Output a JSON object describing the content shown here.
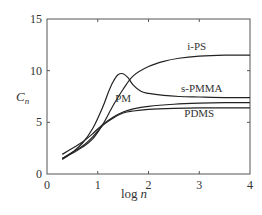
{
  "chart_data": {
    "type": "line",
    "title": "",
    "xlabel": "log n",
    "ylabel": "C_n",
    "xlim": [
      0,
      4
    ],
    "ylim": [
      0,
      15
    ],
    "xticks": [
      0,
      1,
      2,
      3,
      4
    ],
    "yticks": [
      0,
      5,
      10,
      15
    ],
    "grid": false,
    "legend": "inline labels",
    "series": [
      {
        "name": "i-PS",
        "x": [
          0.3,
          0.5,
          0.7,
          0.9,
          1.1,
          1.3,
          1.5,
          1.7,
          2.0,
          2.3,
          2.6,
          3.0,
          3.5,
          4.0
        ],
        "y": [
          1.5,
          2.0,
          2.6,
          3.4,
          4.8,
          6.6,
          8.2,
          9.5,
          10.4,
          10.9,
          11.2,
          11.4,
          11.5,
          11.5
        ]
      },
      {
        "name": "s-PMMA",
        "x": [
          0.3,
          0.5,
          0.7,
          0.9,
          1.1,
          1.2,
          1.3,
          1.4,
          1.5,
          1.6,
          1.7,
          1.85,
          2.0,
          2.3,
          2.6,
          3.0,
          3.5,
          4.0
        ],
        "y": [
          1.4,
          2.1,
          3.0,
          4.4,
          6.5,
          7.8,
          8.9,
          9.6,
          9.7,
          9.3,
          8.6,
          8.0,
          7.8,
          7.6,
          7.5,
          7.45,
          7.4,
          7.4
        ]
      },
      {
        "name": "PM",
        "x": [
          0.3,
          0.5,
          0.7,
          0.9,
          1.1,
          1.3,
          1.5,
          1.7,
          2.0,
          2.5,
          3.0,
          3.5,
          4.0
        ],
        "y": [
          1.9,
          2.5,
          3.1,
          3.9,
          4.8,
          5.5,
          6.0,
          6.3,
          6.55,
          6.75,
          6.85,
          6.9,
          6.9
        ]
      },
      {
        "name": "PDMS",
        "x": [
          0.3,
          0.5,
          0.7,
          0.9,
          1.1,
          1.3,
          1.5,
          1.7,
          2.0,
          2.5,
          3.0,
          3.5,
          4.0
        ],
        "y": [
          1.5,
          2.1,
          2.7,
          3.6,
          4.7,
          5.4,
          5.9,
          6.1,
          6.25,
          6.35,
          6.4,
          6.4,
          6.4
        ]
      }
    ],
    "annotations": [
      {
        "text": "i-PS",
        "x": 2.95,
        "y": 12.0
      },
      {
        "text": "s-PMMA",
        "x": 3.05,
        "y": 7.9
      },
      {
        "text": "PM",
        "x": 1.5,
        "y": 6.95
      },
      {
        "text": "PDMS",
        "x": 3.0,
        "y": 5.55
      }
    ]
  },
  "axes": {
    "xlabel_main": "log",
    "xlabel_var": "n",
    "ylabel_main": "C",
    "ylabel_sub": "n",
    "xtick_labels": [
      "0",
      "1",
      "2",
      "3",
      "4"
    ],
    "ytick_labels": [
      "0",
      "5",
      "10",
      "15"
    ]
  },
  "labels": {
    "ips": "i-PS",
    "spmma": "s-PMMA",
    "pm": "PM",
    "pdms": "PDMS"
  }
}
